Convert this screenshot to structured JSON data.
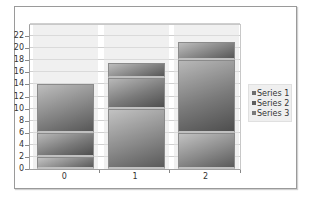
{
  "chart_data": {
    "type": "bar",
    "stacked": true,
    "title": "",
    "xlabel": "",
    "ylabel": "",
    "categories": [
      "0",
      "1",
      "2"
    ],
    "series": [
      {
        "name": "Series 1",
        "values": [
          2,
          10,
          6
        ],
        "color": "#8a8a8a"
      },
      {
        "name": "Series 2",
        "values": [
          4,
          5,
          12
        ],
        "color": "#7a7a7a"
      },
      {
        "name": "Series 3",
        "values": [
          8,
          2.5,
          3
        ],
        "color": "#858585"
      }
    ],
    "ylim": [
      0,
      24
    ],
    "yticks": [
      "0",
      "2",
      "4",
      "6",
      "8",
      "10",
      "12",
      "14",
      "16",
      "18",
      "20",
      "22"
    ],
    "grid": true,
    "legend_position": "right"
  },
  "legend": {
    "items": [
      {
        "label": "Series 1"
      },
      {
        "label": "Series 2"
      },
      {
        "label": "Series 3"
      }
    ]
  }
}
